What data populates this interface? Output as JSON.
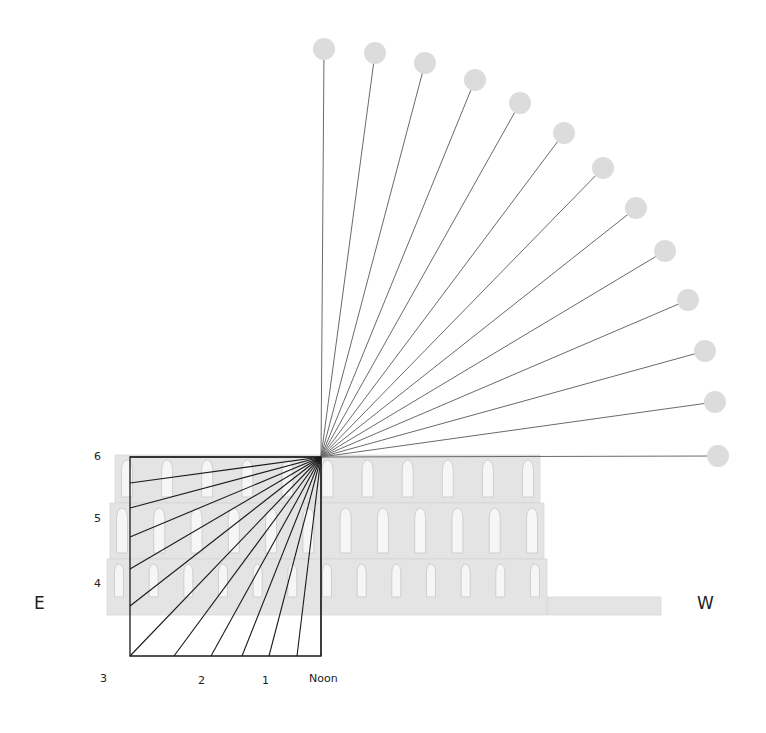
{
  "diagram": {
    "title": "",
    "compass": {
      "east": "E",
      "west": "W"
    },
    "hour_labels": {
      "vertical": [
        {
          "text": "6",
          "x": 94,
          "y": 450
        },
        {
          "text": "5",
          "x": 94,
          "y": 512
        },
        {
          "text": "4",
          "x": 94,
          "y": 577
        }
      ],
      "horizontal": [
        {
          "text": "3",
          "x": 100,
          "y": 672
        },
        {
          "text": "2",
          "x": 198,
          "y": 674
        },
        {
          "text": "1",
          "x": 262,
          "y": 674
        },
        {
          "text": "Noon",
          "x": 309,
          "y": 672
        }
      ]
    },
    "gnomon_point": {
      "x": 321,
      "y": 457
    },
    "sun_positions": [
      {
        "x": 324,
        "y": 49
      },
      {
        "x": 375,
        "y": 53
      },
      {
        "x": 425,
        "y": 63
      },
      {
        "x": 475,
        "y": 80
      },
      {
        "x": 520,
        "y": 103
      },
      {
        "x": 564,
        "y": 133
      },
      {
        "x": 603,
        "y": 168
      },
      {
        "x": 636,
        "y": 208
      },
      {
        "x": 665,
        "y": 251
      },
      {
        "x": 688,
        "y": 300
      },
      {
        "x": 705,
        "y": 351
      },
      {
        "x": 715,
        "y": 402
      },
      {
        "x": 718,
        "y": 456
      }
    ],
    "shadow_endpoints": [
      {
        "x": 130,
        "y": 457
      },
      {
        "x": 130,
        "y": 483
      },
      {
        "x": 130,
        "y": 508
      },
      {
        "x": 130,
        "y": 537
      },
      {
        "x": 130,
        "y": 569
      },
      {
        "x": 130,
        "y": 606
      },
      {
        "x": 130,
        "y": 656
      },
      {
        "x": 174,
        "y": 656
      },
      {
        "x": 211,
        "y": 656
      },
      {
        "x": 242,
        "y": 656
      },
      {
        "x": 269,
        "y": 656
      },
      {
        "x": 297,
        "y": 656
      },
      {
        "x": 321,
        "y": 656
      }
    ],
    "shadow_box": {
      "left": 130,
      "top": 457,
      "right": 321,
      "bottom": 656
    },
    "facade": {
      "tiers": [
        {
          "x1": 115,
          "y1": 455,
          "x2": 540,
          "y2": 503,
          "windows": 11
        },
        {
          "x1": 110,
          "y1": 503,
          "x2": 544,
          "y2": 559,
          "windows": 12
        },
        {
          "x1": 107,
          "y1": 559,
          "x2": 547,
          "y2": 615,
          "windows": 13
        }
      ],
      "extension": {
        "x1": 547,
        "y1": 597,
        "x2": 661,
        "y2": 615
      }
    },
    "colors": {
      "sun": "#dcdcdc",
      "ray": "#6a6a6a",
      "shadow_line": "#1a1a1a",
      "facade": "#e4e4e4",
      "facade_edge": "#cfcfcf",
      "window": "#f6f6f6",
      "window_edge": "#c8c8c8"
    }
  }
}
